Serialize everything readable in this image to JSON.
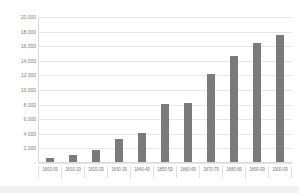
{
  "chart_data": {
    "type": "bar",
    "title": "",
    "subtitle": "",
    "xlabel": "",
    "ylabel": "",
    "categories": [
      "1800-09",
      "1810-19",
      "1820-29",
      "1830-39",
      "1840-49",
      "1850-59",
      "1860-69",
      "1870-79",
      "1880-89",
      "1890-99",
      "1900-09"
    ],
    "values": [
      500,
      900,
      1600,
      3100,
      4000,
      7900,
      8050,
      12000,
      14500,
      16300,
      17400
    ],
    "ylim": [
      0,
      20000
    ],
    "ytick_values": [
      0,
      2000,
      4000,
      6000,
      8000,
      10000,
      12000,
      14000,
      16000,
      18000,
      20000
    ],
    "ytick_labels": [
      "-",
      "2,000",
      "4,000",
      "6,000",
      "8,000",
      "10,000",
      "12,000",
      "14,000",
      "16,000",
      "18,000",
      "20,000"
    ],
    "grid": true,
    "legend": false,
    "legend_position": "none",
    "series": [
      {
        "name": "",
        "color": "#7b7b7b",
        "values": [
          500,
          900,
          1600,
          3100,
          4000,
          7900,
          8050,
          12000,
          14500,
          16300,
          17400
        ]
      }
    ],
    "colors": {
      "bar": "#7b7b7b",
      "gridline": "#e6e6e6",
      "axis": "#d9d9d9",
      "tick_text": "#7f7f7f",
      "plot_background": "#ffffff",
      "page_background": "#ffffff",
      "bottom_band": "#f2f2f2"
    }
  }
}
